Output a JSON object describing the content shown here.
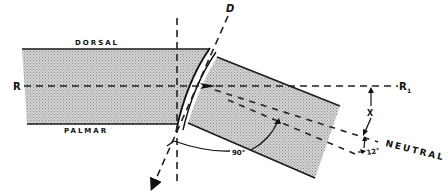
{
  "diagram": {
    "labels": {
      "dorsal": "DORSAL",
      "palmar": "PALMAR",
      "r": "R",
      "r1": "R",
      "r1_sub": "1",
      "d": "D",
      "x": "X",
      "neutral": "NEUTRAL",
      "angle_12": "12°",
      "angle_90": "90°"
    },
    "colors": {
      "fill": "#c9c9c9",
      "line": "#1a1a1a",
      "background": "#ffffff"
    },
    "shapes": {
      "forearm_segment": "stippled rectangle (left)",
      "hand_segment": "stippled rotated rectangle (right)",
      "joint_arc": "curved double arc between segments"
    }
  }
}
